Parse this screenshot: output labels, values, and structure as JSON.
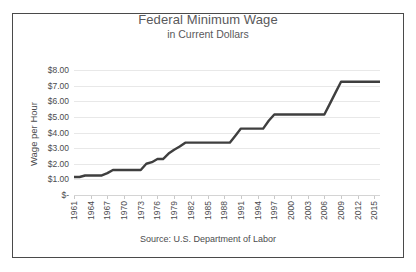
{
  "chart_data": {
    "type": "line",
    "title": "Federal Minimum Wage",
    "subtitle": "in Current Dollars",
    "xlabel": "",
    "ylabel": "Wage per Hour",
    "source": "Source:  U.S. Department of Labor",
    "grid": true,
    "legend": "none",
    "line_color": "#3f3f3f",
    "grid_color": "#e8e8e8",
    "xlim": [
      1961,
      2016
    ],
    "ylim": [
      0,
      8
    ],
    "ytick_values": [
      0,
      1,
      2,
      3,
      4,
      5,
      6,
      7,
      8
    ],
    "ytick_labels": [
      "$-",
      "$1.00",
      "$2.00",
      "$3.00",
      "$4.00",
      "$5.00",
      "$6.00",
      "$7.00",
      "$8.00"
    ],
    "xtick_labels": [
      "1961",
      "1964",
      "1967",
      "1970",
      "1973",
      "1976",
      "1979",
      "1982",
      "1985",
      "1988",
      "1991",
      "1994",
      "1997",
      "2000",
      "2003",
      "2006",
      "2009",
      "2012",
      "2015"
    ],
    "series": [
      {
        "name": "Federal Minimum Wage",
        "x": [
          1961,
          1962,
          1963,
          1964,
          1965,
          1966,
          1967,
          1968,
          1969,
          1970,
          1971,
          1972,
          1973,
          1974,
          1975,
          1976,
          1977,
          1978,
          1979,
          1980,
          1981,
          1982,
          1983,
          1984,
          1985,
          1986,
          1987,
          1988,
          1989,
          1990,
          1991,
          1992,
          1993,
          1994,
          1995,
          1996,
          1997,
          1998,
          1999,
          2000,
          2001,
          2002,
          2003,
          2004,
          2005,
          2006,
          2007,
          2008,
          2009,
          2010,
          2011,
          2012,
          2013,
          2014,
          2015,
          2016
        ],
        "values": [
          1.15,
          1.15,
          1.25,
          1.25,
          1.25,
          1.25,
          1.4,
          1.6,
          1.6,
          1.6,
          1.6,
          1.6,
          1.6,
          2.0,
          2.1,
          2.3,
          2.3,
          2.65,
          2.9,
          3.1,
          3.35,
          3.35,
          3.35,
          3.35,
          3.35,
          3.35,
          3.35,
          3.35,
          3.35,
          3.8,
          4.25,
          4.25,
          4.25,
          4.25,
          4.25,
          4.75,
          5.15,
          5.15,
          5.15,
          5.15,
          5.15,
          5.15,
          5.15,
          5.15,
          5.15,
          5.15,
          5.85,
          6.55,
          7.25,
          7.25,
          7.25,
          7.25,
          7.25,
          7.25,
          7.25,
          7.25
        ]
      }
    ]
  }
}
